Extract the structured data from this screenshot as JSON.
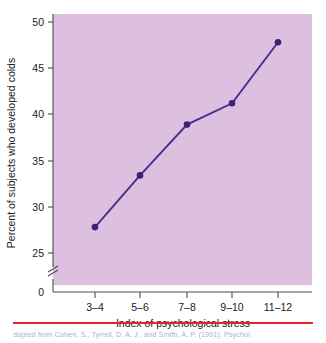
{
  "chart_data": {
    "type": "line",
    "title": "",
    "xlabel": "Index of psychological stress",
    "ylabel": "Percent of subjects who developed colds",
    "categories": [
      "3–4",
      "5–6",
      "7–8",
      "9–10",
      "11–12"
    ],
    "values": [
      27.8,
      33.4,
      38.9,
      41.2,
      47.8
    ],
    "ytick_labels": [
      "0",
      "25",
      "30",
      "35",
      "40",
      "45",
      "50"
    ],
    "yticks": [
      0,
      25,
      30,
      35,
      40,
      45,
      50
    ],
    "ylim": [
      25,
      50
    ],
    "axis_break": true,
    "grid": false,
    "legend": false,
    "series": [
      {
        "name": "Percent who developed colds",
        "values": [
          27.8,
          33.4,
          38.9,
          41.2,
          47.8
        ]
      }
    ],
    "colors": {
      "plot_background": "#ddbfe0",
      "line": "#4a2d8c",
      "marker": "#3b2273",
      "axis": "#4d4d4d",
      "text": "#1a1a1a",
      "rule": "#e8222c"
    }
  },
  "caption": {
    "text": "dapted from Cohen, S., Tyrrell, D. A. J., and Smith, A. P. (1991). Psychol"
  }
}
